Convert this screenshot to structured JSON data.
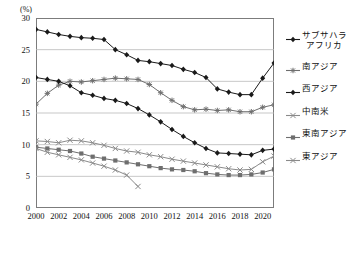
{
  "axis": {
    "unit_label": "(%)",
    "y_ticks": [
      0,
      5,
      10,
      15,
      20,
      25,
      30
    ],
    "x_ticks": [
      2000,
      2002,
      2004,
      2006,
      2008,
      2010,
      2012,
      2014,
      2016,
      2018,
      2020
    ]
  },
  "legend": {
    "items": [
      {
        "label": "サブサハラ\nアフリカ",
        "label_line1": "サブサハラ",
        "label_line2": "アフリカ",
        "marker": "diamond",
        "color": "#1a1a1a"
      },
      {
        "label": "南アジア",
        "label_line1": "南アジア",
        "label_line2": "",
        "marker": "star",
        "color": "#6e6e6e"
      },
      {
        "label": "西アジア",
        "label_line1": "西アジア",
        "label_line2": "",
        "marker": "diamond",
        "color": "#1a1a1a"
      },
      {
        "label": "中南米",
        "label_line1": "中南米",
        "label_line2": "",
        "marker": "cross",
        "color": "#8a8a8a"
      },
      {
        "label": "東南アジア",
        "label_line1": "東南アジア",
        "label_line2": "",
        "marker": "square",
        "color": "#6e6e6e"
      },
      {
        "label": "東アジア",
        "label_line1": "東アジア",
        "label_line2": "",
        "marker": "cross",
        "color": "#8a8a8a"
      }
    ]
  },
  "chart_data": {
    "type": "line",
    "title": "",
    "xlabel": "",
    "ylabel": "(%)",
    "xlim": [
      2000,
      2021
    ],
    "ylim": [
      0,
      30
    ],
    "grid": true,
    "legend_position": "right",
    "x": [
      2000,
      2001,
      2002,
      2003,
      2004,
      2005,
      2006,
      2007,
      2008,
      2009,
      2010,
      2011,
      2012,
      2013,
      2014,
      2015,
      2016,
      2017,
      2018,
      2019,
      2020,
      2021
    ],
    "series": [
      {
        "name": "サブサハラアフリカ",
        "marker": "diamond",
        "color": "#1a1a1a",
        "values": [
          28.2,
          27.8,
          27.4,
          27.1,
          26.9,
          26.8,
          26.6,
          25.0,
          24.2,
          23.3,
          23.1,
          22.8,
          22.5,
          21.9,
          21.4,
          20.6,
          18.8,
          18.3,
          17.9,
          17.9,
          20.5,
          22.9
        ]
      },
      {
        "name": "南アジア",
        "marker": "star",
        "color": "#6e6e6e",
        "values": [
          16.4,
          18.1,
          19.4,
          20.0,
          19.9,
          20.1,
          20.3,
          20.5,
          20.4,
          20.3,
          19.5,
          18.2,
          17.0,
          16.0,
          15.5,
          15.6,
          15.4,
          15.5,
          15.2,
          15.2,
          15.9,
          16.3
        ]
      },
      {
        "name": "西アジア",
        "marker": "diamond",
        "color": "#1a1a1a",
        "values": [
          20.6,
          20.3,
          20.0,
          19.3,
          18.2,
          17.8,
          17.3,
          17.0,
          16.5,
          15.7,
          14.7,
          13.6,
          12.4,
          11.3,
          10.3,
          9.4,
          8.7,
          8.6,
          8.5,
          8.4,
          9.1,
          9.3
        ]
      },
      {
        "name": "中南米",
        "marker": "cross",
        "color": "#8a8a8a",
        "values": [
          10.6,
          10.5,
          10.3,
          10.7,
          10.6,
          10.3,
          9.9,
          9.4,
          9.0,
          8.8,
          8.4,
          8.1,
          7.7,
          7.4,
          7.1,
          6.8,
          6.5,
          6.2,
          6.0,
          6.1,
          7.3,
          8.2
        ]
      },
      {
        "name": "東南アジア",
        "marker": "square",
        "color": "#6e6e6e",
        "values": [
          9.6,
          9.4,
          9.2,
          9.0,
          8.6,
          8.1,
          7.8,
          7.5,
          7.2,
          6.9,
          6.6,
          6.3,
          6.1,
          6.0,
          5.8,
          5.5,
          5.3,
          5.2,
          5.2,
          5.3,
          5.6,
          6.1
        ]
      },
      {
        "name": "東アジア",
        "marker": "cross",
        "color": "#8a8a8a",
        "values": [
          9.4,
          8.8,
          8.4,
          8.0,
          7.6,
          7.1,
          6.6,
          6.0,
          5.2,
          3.4,
          null,
          null,
          null,
          null,
          null,
          null,
          null,
          null,
          null,
          null,
          null,
          null
        ]
      }
    ]
  }
}
